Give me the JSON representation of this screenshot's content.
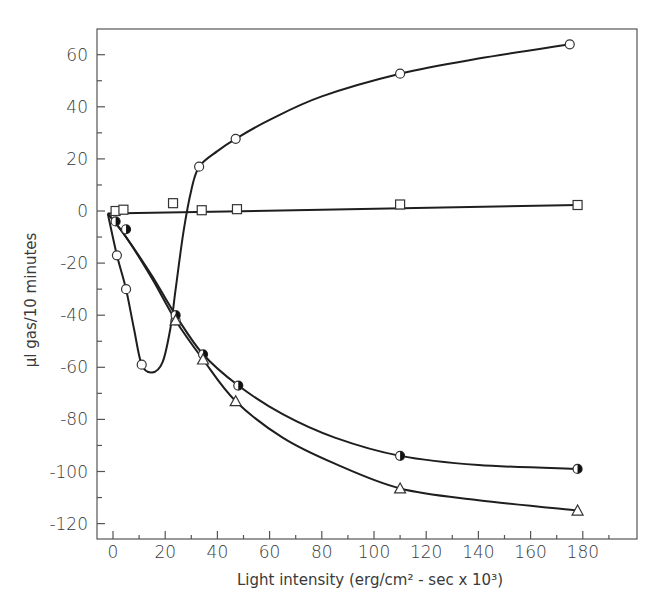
{
  "chart_data": {
    "type": "line",
    "title": "",
    "xlabel": "Light intensity (erg/cm² - sec x 10³)",
    "ylabel": "μl gas/10 minutes",
    "xlim": [
      -5,
      200
    ],
    "ylim": [
      -126,
      70
    ],
    "x_ticks": [
      0,
      20,
      40,
      60,
      80,
      100,
      120,
      140,
      160,
      180
    ],
    "x_tick_labels": [
      "0",
      "20",
      "40",
      "60",
      "80",
      "100",
      "120",
      "140",
      "160",
      "180"
    ],
    "y_ticks": [
      60,
      40,
      20,
      0,
      -20,
      -40,
      -60,
      -80,
      -100,
      -120
    ],
    "y_tick_labels": [
      "60",
      "40",
      "20",
      "0",
      "-20",
      "-40",
      "-60",
      "-80",
      "-100",
      "-120"
    ],
    "grid": false,
    "legend": null,
    "series": [
      {
        "name": "open-circles",
        "marker": "circle-open",
        "points": [
          [
            1.5,
            -17
          ],
          [
            5,
            -30
          ],
          [
            11,
            -59
          ],
          [
            24,
            -42
          ],
          [
            33,
            17
          ],
          [
            47,
            27.7
          ],
          [
            110,
            52.7
          ],
          [
            175,
            64
          ]
        ],
        "curve": [
          [
            -2,
            -1
          ],
          [
            1.5,
            -17
          ],
          [
            5,
            -30
          ],
          [
            8,
            -45
          ],
          [
            11,
            -59
          ],
          [
            15,
            -62
          ],
          [
            19,
            -58
          ],
          [
            22,
            -45
          ],
          [
            24,
            -30
          ],
          [
            27,
            -8
          ],
          [
            30,
            8
          ],
          [
            33,
            17
          ],
          [
            40,
            23
          ],
          [
            47,
            27.7
          ],
          [
            60,
            35
          ],
          [
            80,
            44
          ],
          [
            110,
            52.7
          ],
          [
            140,
            58.5
          ],
          [
            175,
            64
          ]
        ]
      },
      {
        "name": "open-squares",
        "marker": "square-open",
        "points": [
          [
            1,
            0
          ],
          [
            4,
            0.5
          ],
          [
            23,
            3
          ],
          [
            34,
            0.3
          ],
          [
            47.5,
            0.7
          ],
          [
            110,
            2.5
          ],
          [
            178,
            2.3
          ]
        ],
        "curve": [
          [
            -2,
            -1
          ],
          [
            178,
            2.3
          ]
        ]
      },
      {
        "name": "half-filled-circles",
        "marker": "circle-half",
        "points": [
          [
            1,
            -4
          ],
          [
            5,
            -7
          ],
          [
            24,
            -40
          ],
          [
            34.5,
            -55
          ],
          [
            48,
            -67
          ],
          [
            110,
            -94
          ],
          [
            178,
            -99
          ]
        ],
        "curve": [
          [
            -2,
            -1
          ],
          [
            5,
            -10
          ],
          [
            15,
            -25
          ],
          [
            24,
            -40
          ],
          [
            34.5,
            -55
          ],
          [
            48,
            -67
          ],
          [
            65,
            -78
          ],
          [
            85,
            -87
          ],
          [
            110,
            -94
          ],
          [
            140,
            -97.5
          ],
          [
            178,
            -99
          ]
        ]
      },
      {
        "name": "open-triangles",
        "marker": "triangle-open",
        "points": [
          [
            24,
            -42
          ],
          [
            34.5,
            -57
          ],
          [
            47,
            -73
          ],
          [
            110,
            -106.5
          ],
          [
            178,
            -115
          ]
        ],
        "curve": [
          [
            -2,
            -1
          ],
          [
            5,
            -10
          ],
          [
            15,
            -26
          ],
          [
            24,
            -42
          ],
          [
            34.5,
            -57
          ],
          [
            47,
            -73
          ],
          [
            65,
            -87
          ],
          [
            85,
            -97
          ],
          [
            110,
            -106.5
          ],
          [
            140,
            -111
          ],
          [
            178,
            -115
          ]
        ]
      }
    ]
  }
}
